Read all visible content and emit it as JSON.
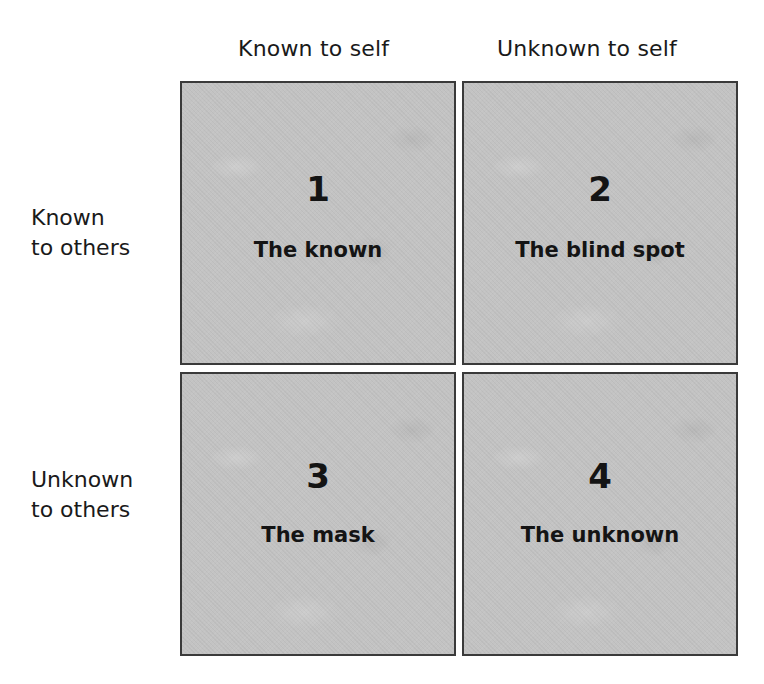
{
  "columns": [
    {
      "label": "Known to self"
    },
    {
      "label": "Unknown to self"
    }
  ],
  "rows": [
    {
      "line1": "Known",
      "line2": "to others"
    },
    {
      "line1": "Unknown",
      "line2": "to others"
    }
  ],
  "quadrants": [
    {
      "number": "1",
      "label": "The known"
    },
    {
      "number": "2",
      "label": "The blind spot"
    },
    {
      "number": "3",
      "label": "The mask"
    },
    {
      "number": "4",
      "label": "The unknown"
    }
  ],
  "colors": {
    "cell_fill": "#c3c3c3",
    "cell_border": "#3a3a3a",
    "text": "#141414"
  }
}
